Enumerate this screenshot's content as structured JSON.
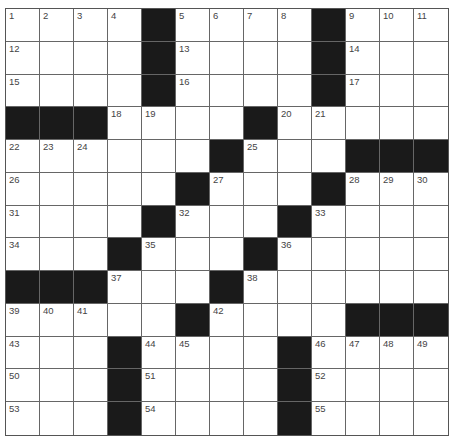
{
  "puzzle": {
    "rows": 13,
    "cols": 13,
    "colors": {
      "block": "#1a1a1a",
      "cell": "#ffffff",
      "line": "#666666",
      "number": "#444444"
    },
    "layout": [
      "....#....#...",
      "....#....#...",
      "....#....#...",
      "###....#.....",
      "......#...###",
      ".....#...#...",
      "....#...#....",
      "...#...#.....",
      "###...#......",
      ".....#....###",
      "...#....#....",
      "...#....#....",
      "...#....#...."
    ],
    "numbers": [
      [
        "1",
        "2",
        "3",
        "4",
        "",
        "5",
        "6",
        "7",
        "8",
        "",
        "9",
        "10",
        "11"
      ],
      [
        "12",
        "",
        "",
        "",
        "",
        "13",
        "",
        "",
        "",
        "",
        "14",
        "",
        ""
      ],
      [
        "15",
        "",
        "",
        "",
        "",
        "16",
        "",
        "",
        "",
        "",
        "17",
        "",
        ""
      ],
      [
        "",
        "",
        "",
        "18",
        "19",
        "",
        "",
        "",
        "20",
        "21",
        "",
        "",
        ""
      ],
      [
        "22",
        "23",
        "24",
        "",
        "",
        "",
        "",
        "25",
        "",
        "",
        "",
        "",
        ""
      ],
      [
        "26",
        "",
        "",
        "",
        "",
        "",
        "27",
        "",
        "",
        "",
        "28",
        "29",
        "30"
      ],
      [
        "31",
        "",
        "",
        "",
        "",
        "32",
        "",
        "",
        "",
        "33",
        "",
        "",
        ""
      ],
      [
        "34",
        "",
        "",
        "",
        "35",
        "",
        "",
        "",
        "36",
        "",
        "",
        "",
        ""
      ],
      [
        "",
        "",
        "",
        "37",
        "",
        "",
        "",
        "38",
        "",
        "",
        "",
        "",
        ""
      ],
      [
        "39",
        "40",
        "41",
        "",
        "",
        "",
        "42",
        "",
        "",
        "",
        "",
        "",
        ""
      ],
      [
        "43",
        "",
        "",
        "",
        "44",
        "45",
        "",
        "",
        "",
        "46",
        "47",
        "48",
        "49"
      ],
      [
        "50",
        "",
        "",
        "",
        "51",
        "",
        "",
        "",
        "",
        "52",
        "",
        "",
        ""
      ],
      [
        "53",
        "",
        "",
        "",
        "54",
        "",
        "",
        "",
        "",
        "55",
        "",
        "",
        ""
      ]
    ]
  }
}
